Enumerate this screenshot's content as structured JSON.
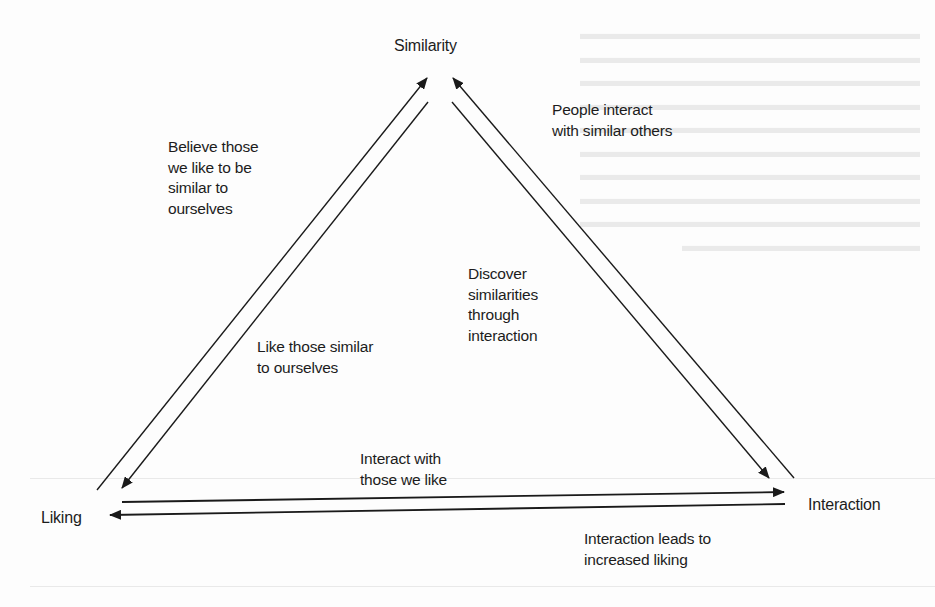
{
  "diagram": {
    "type": "triangle-cycle",
    "stroke_color": "#1a1a1a",
    "nodes": {
      "similarity": "Similarity",
      "liking": "Liking",
      "interaction": "Interaction"
    },
    "edges": [
      {
        "id": "liking-to-similarity",
        "from": "Liking",
        "to": "Similarity",
        "lines": [
          "Believe those",
          "we like to be",
          "similar to",
          "ourselves"
        ]
      },
      {
        "id": "similarity-to-liking",
        "from": "Similarity",
        "to": "Liking",
        "lines": [
          "Like those similar",
          "to ourselves"
        ]
      },
      {
        "id": "interaction-to-similarity",
        "from": "Interaction",
        "to": "Similarity",
        "lines": [
          "People interact",
          "with similar others"
        ]
      },
      {
        "id": "similarity-to-interaction",
        "from": "Similarity",
        "to": "Interaction",
        "lines": [
          "Discover",
          "similarities",
          "through",
          "interaction"
        ]
      },
      {
        "id": "liking-to-interaction",
        "from": "Liking",
        "to": "Interaction",
        "lines": [
          "Interact with",
          "those we like"
        ]
      },
      {
        "id": "interaction-to-liking",
        "from": "Interaction",
        "to": "Liking",
        "lines": [
          "Interaction leads to",
          "increased liking"
        ]
      }
    ]
  }
}
